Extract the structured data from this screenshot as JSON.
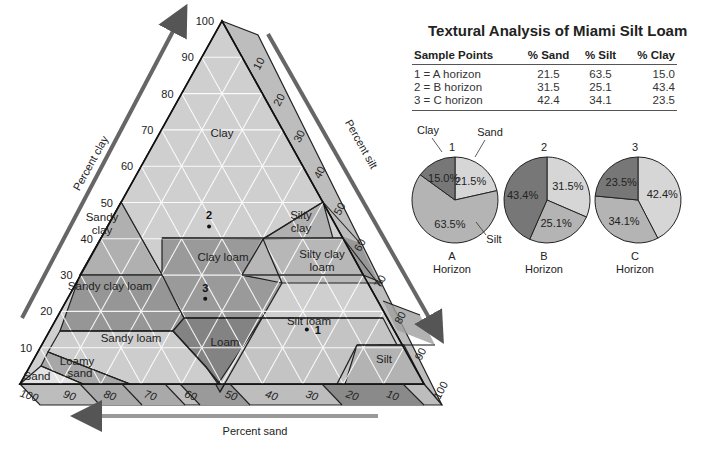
{
  "diagram": {
    "type": "soil-texture-triangle",
    "axes": {
      "clay": {
        "label": "Percent clay",
        "ticks": [
          "10",
          "20",
          "30",
          "40",
          "50",
          "60",
          "70",
          "80",
          "90",
          "100"
        ]
      },
      "silt": {
        "label": "Percent silt",
        "ticks": [
          "10",
          "20",
          "30",
          "40",
          "50",
          "60",
          "70",
          "80",
          "90",
          "100"
        ]
      },
      "sand": {
        "label": "Percent sand",
        "ticks": [
          "100",
          "90",
          "80",
          "70",
          "60",
          "50",
          "40",
          "30",
          "20",
          "10"
        ]
      }
    },
    "regions": {
      "clay": "Clay",
      "sandy_clay_1": "Sandy",
      "sandy_clay_2": "clay",
      "silty_clay_1": "Silty",
      "silty_clay_2": "clay",
      "clay_loam": "Clay loam",
      "silty_clay_loam_1": "Silty clay",
      "silty_clay_loam_2": "loam",
      "sandy_clay_loam": "Sandy clay loam",
      "loam": "Loam",
      "silt_loam": "Silt loam",
      "sandy_loam": "Sandy loam",
      "loamy_sand_1": "Loamy",
      "loamy_sand_2": "sand",
      "sand": "Sand",
      "silt": "Silt"
    },
    "sample_points": [
      {
        "label": "1",
        "sand": 21.5,
        "silt": 63.5,
        "clay": 15.0
      },
      {
        "label": "2",
        "sand": 31.5,
        "silt": 25.1,
        "clay": 43.4
      },
      {
        "label": "3",
        "sand": 42.4,
        "silt": 34.1,
        "clay": 23.5
      }
    ]
  },
  "table": {
    "title": "Textural Analysis of Miami Silt Loam",
    "headers": [
      "Sample Points",
      "% Sand",
      "% Silt",
      "% Clay"
    ],
    "rows": [
      [
        "1 = A horizon",
        "21.5",
        "63.5",
        "15.0"
      ],
      [
        "2 = B horizon",
        "31.5",
        "25.1",
        "43.4"
      ],
      [
        "3 = C horizon",
        "42.4",
        "34.1",
        "23.5"
      ]
    ]
  },
  "pies": [
    {
      "number": "1",
      "letter": "A",
      "sub": "Horizon",
      "slices": [
        {
          "name": "Sand",
          "value": 21.5,
          "label": "21.5%"
        },
        {
          "name": "Silt",
          "value": 63.5,
          "label": "63.5%"
        },
        {
          "name": "Clay",
          "value": 15.0,
          "label": "15.0%"
        }
      ],
      "callouts": {
        "clay": "Clay",
        "sand": "Sand",
        "silt": "Silt"
      }
    },
    {
      "number": "2",
      "letter": "B",
      "sub": "Horizon",
      "slices": [
        {
          "name": "Sand",
          "value": 31.5,
          "label": "31.5%"
        },
        {
          "name": "Silt",
          "value": 25.1,
          "label": "25.1%"
        },
        {
          "name": "Clay",
          "value": 43.4,
          "label": "43.4%"
        }
      ]
    },
    {
      "number": "3",
      "letter": "C",
      "sub": "Horizon",
      "slices": [
        {
          "name": "Sand",
          "value": 42.4,
          "label": "42.4%"
        },
        {
          "name": "Silt",
          "value": 34.1,
          "label": "34.1%"
        },
        {
          "name": "Clay",
          "value": 23.5,
          "label": "23.5%"
        }
      ]
    }
  ],
  "colors": {
    "sand_slice": "#d6d6d6",
    "silt_slice": "#b4b4b4",
    "clay_slice": "#777777",
    "light_region": "#cfcfcf",
    "mid_region": "#a9a9a9",
    "dark_region": "#858585",
    "band_light": "#bdbdbd",
    "band_dark": "#8e8e8e",
    "arrow": "#6a6a6a"
  }
}
